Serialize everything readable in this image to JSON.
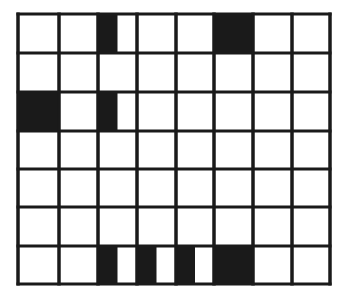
{
  "diagram": {
    "type": "grid",
    "rows": 7,
    "cols": 8,
    "line_color": "#1a1a1a",
    "fill_color": "#1a1a1a",
    "background": "#ffffff",
    "x_lines": [
      18,
      59,
      98,
      137,
      176,
      214,
      253,
      292,
      330
    ],
    "y_lines": [
      14,
      53,
      92,
      131,
      169,
      207,
      246,
      284
    ],
    "filled_cells": [
      {
        "row": 0,
        "col": 2,
        "portion": "left-half"
      },
      {
        "row": 0,
        "col": 5,
        "portion": "full"
      },
      {
        "row": 2,
        "col": 0,
        "portion": "full"
      },
      {
        "row": 2,
        "col": 2,
        "portion": "left-half"
      },
      {
        "row": 6,
        "col": 2,
        "portion": "left-half"
      },
      {
        "row": 6,
        "col": 3,
        "portion": "left-half"
      },
      {
        "row": 6,
        "col": 4,
        "portion": "left-half"
      },
      {
        "row": 6,
        "col": 5,
        "portion": "full"
      }
    ]
  }
}
